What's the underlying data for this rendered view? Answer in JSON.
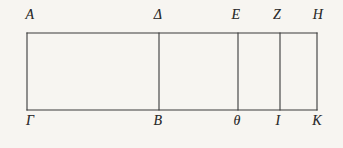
{
  "figure": {
    "kind": "geometric-diagram",
    "background_color": "#f7f5f1",
    "line_color": "#3a3a3a",
    "label_color": "#2b2b2b",
    "line_width": 1.1,
    "frame": {
      "left": 27,
      "top": 33,
      "right": 317,
      "bottom": 110
    },
    "dividers": [
      {
        "name": "divider-delta-beta",
        "x": 159
      },
      {
        "name": "divider-epsilon-theta",
        "x": 238
      },
      {
        "name": "divider-zeta-iota",
        "x": 280
      }
    ],
    "top_labels": [
      {
        "id": "label-A",
        "text": "A",
        "x": 30,
        "y": 8
      },
      {
        "id": "label-Delta",
        "text": "Δ",
        "x": 158,
        "y": 8
      },
      {
        "id": "label-E",
        "text": "E",
        "x": 236,
        "y": 8
      },
      {
        "id": "label-Z",
        "text": "Z",
        "x": 277,
        "y": 8
      },
      {
        "id": "label-H",
        "text": "H",
        "x": 318,
        "y": 8
      }
    ],
    "bottom_labels": [
      {
        "id": "label-Gamma",
        "text": "Γ",
        "x": 30,
        "y": 114
      },
      {
        "id": "label-B",
        "text": "B",
        "x": 158,
        "y": 114
      },
      {
        "id": "label-theta",
        "text": "θ",
        "x": 237,
        "y": 114
      },
      {
        "id": "label-I",
        "text": "I",
        "x": 278,
        "y": 114
      },
      {
        "id": "label-K",
        "text": "K",
        "x": 317,
        "y": 114
      }
    ]
  }
}
